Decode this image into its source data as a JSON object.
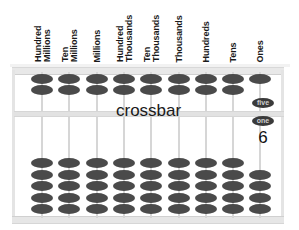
{
  "diagram": {
    "type": "abacus",
    "crossbar_label": "crossbar",
    "bead_labels": {
      "heaven_bead": "five",
      "earth_bead": "one"
    },
    "displayed_value_label": "6",
    "columns": [
      {
        "label": "Hundred\nMillions",
        "upper_beads": 2,
        "upper_active": 0,
        "lower_beads": 5,
        "lower_active": 0
      },
      {
        "label": "Ten\nMillions",
        "upper_beads": 2,
        "upper_active": 0,
        "lower_beads": 5,
        "lower_active": 0
      },
      {
        "label": "Millions",
        "upper_beads": 2,
        "upper_active": 0,
        "lower_beads": 5,
        "lower_active": 0
      },
      {
        "label": "Hundred\nThousands",
        "upper_beads": 2,
        "upper_active": 0,
        "lower_beads": 5,
        "lower_active": 0
      },
      {
        "label": "Ten\nThousands",
        "upper_beads": 2,
        "upper_active": 0,
        "lower_beads": 5,
        "lower_active": 0
      },
      {
        "label": "Thousands",
        "upper_beads": 2,
        "upper_active": 0,
        "lower_beads": 5,
        "lower_active": 0
      },
      {
        "label": "Hundreds",
        "upper_beads": 2,
        "upper_active": 0,
        "lower_beads": 5,
        "lower_active": 0
      },
      {
        "label": "Tens",
        "upper_beads": 2,
        "upper_active": 0,
        "lower_beads": 5,
        "lower_active": 0
      },
      {
        "label": "Ones",
        "upper_beads": 2,
        "upper_active": 1,
        "lower_beads": 5,
        "lower_active": 1
      }
    ]
  },
  "colors": {
    "bead": "#4a4a4a",
    "frame": "#e4e4e4",
    "text": "#1a1a1a"
  }
}
